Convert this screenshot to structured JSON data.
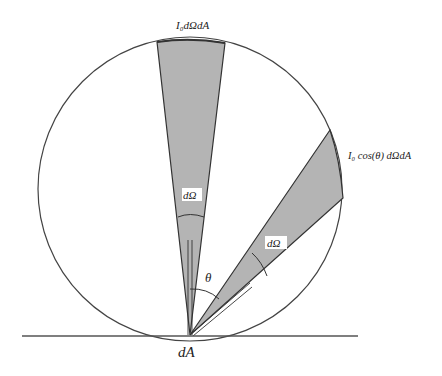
{
  "diagram": {
    "labels": {
      "top_cone": "I₀dΩdA",
      "tilted_cone": "I₀ cos(θ) dΩdA",
      "solid_angle_vertical": "dΩ",
      "solid_angle_tilted": "dΩ",
      "angle": "θ",
      "surface": "dA"
    },
    "colors": {
      "cone_fill": "#b4b4b4",
      "stroke": "#333333",
      "background": "#ffffff"
    },
    "elements": [
      {
        "type": "circle",
        "name": "emission-sphere",
        "cx": 190,
        "cy": 189,
        "r": 152
      },
      {
        "type": "line",
        "name": "surface-line",
        "x1": 22,
        "y1": 336,
        "x2": 358,
        "y2": 336
      },
      {
        "type": "cone",
        "name": "vertical-cone",
        "apex": [
          190,
          335
        ],
        "direction": "normal"
      },
      {
        "type": "cone",
        "name": "tilted-cone",
        "apex": [
          190,
          335
        ],
        "direction": "theta from normal"
      }
    ]
  }
}
